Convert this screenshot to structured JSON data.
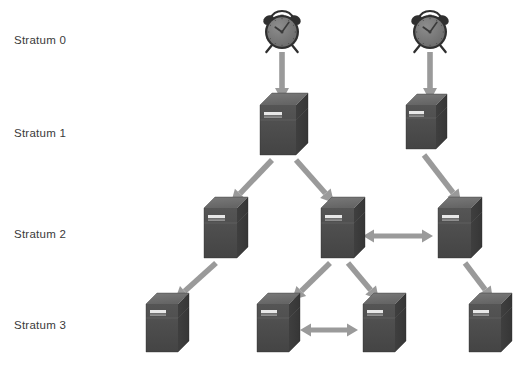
{
  "figure": {
    "background_color": "#ffffff",
    "width": 525,
    "height": 374
  },
  "colors": {
    "background": "#ffffff",
    "label_text": "#3a3a3a",
    "arrow": "#9a9a9a",
    "arrow_dark": "#8c8c8c",
    "server_front": "#4c4c4c",
    "server_top": "#6e6e6e",
    "server_side": "#3c3c3c",
    "server_seam": "#5e5e5e",
    "server_led": "#e8e8e8",
    "clock_body": "#6b6b6b",
    "clock_rim": "#2f2f2f",
    "clock_face": "#7e7e7e",
    "clock_hands": "#3a3a3a"
  },
  "labels": [
    {
      "id": "stratum-0",
      "text": "Stratum 0",
      "x": 14,
      "y": 35
    },
    {
      "id": "stratum-1",
      "text": "Stratum 1",
      "x": 14,
      "y": 128
    },
    {
      "id": "stratum-2",
      "text": "Stratum 2",
      "x": 14,
      "y": 229
    },
    {
      "id": "stratum-3",
      "text": "Stratum 3",
      "x": 14,
      "y": 320
    }
  ],
  "clocks": [
    {
      "id": "clock-left",
      "name": "reference-clock-left",
      "cx": 282,
      "cy": 32,
      "r": 17
    },
    {
      "id": "clock-right",
      "name": "reference-clock-right",
      "cx": 430,
      "cy": 32,
      "r": 17
    }
  ],
  "servers": [
    {
      "id": "s1-a",
      "name": "server-stratum1-a",
      "stratum": 1,
      "x": 260,
      "y": 105,
      "w": 36,
      "h": 50,
      "d": 12
    },
    {
      "id": "s1-b",
      "name": "server-stratum1-b",
      "stratum": 1,
      "x": 406,
      "y": 105,
      "w": 30,
      "h": 44,
      "d": 11
    },
    {
      "id": "s2-a",
      "name": "server-stratum2-a",
      "stratum": 2,
      "x": 204,
      "y": 208,
      "w": 33,
      "h": 50,
      "d": 11
    },
    {
      "id": "s2-b",
      "name": "server-stratum2-b",
      "stratum": 2,
      "x": 321,
      "y": 208,
      "w": 33,
      "h": 50,
      "d": 11
    },
    {
      "id": "s2-c",
      "name": "server-stratum2-c",
      "stratum": 2,
      "x": 438,
      "y": 208,
      "w": 33,
      "h": 50,
      "d": 11
    },
    {
      "id": "s3-a",
      "name": "server-stratum3-a",
      "stratum": 3,
      "x": 146,
      "y": 304,
      "w": 32,
      "h": 48,
      "d": 11
    },
    {
      "id": "s3-b",
      "name": "server-stratum3-b",
      "stratum": 3,
      "x": 257,
      "y": 304,
      "w": 32,
      "h": 48,
      "d": 11
    },
    {
      "id": "s3-c",
      "name": "server-stratum3-c",
      "stratum": 3,
      "x": 363,
      "y": 304,
      "w": 32,
      "h": 48,
      "d": 11
    },
    {
      "id": "s3-d",
      "name": "server-stratum3-d",
      "stratum": 3,
      "x": 469,
      "y": 304,
      "w": 32,
      "h": 48,
      "d": 11
    }
  ],
  "arrows": [
    {
      "id": "a-clk-l-s1a",
      "name": "arrow-clock-left-to-stratum1-a",
      "from": "clock-left",
      "to": "s1-a",
      "x1": 282,
      "y1": 52,
      "x2": 282,
      "y2": 101,
      "double": false
    },
    {
      "id": "a-clk-r-s1b",
      "name": "arrow-clock-right-to-stratum1-b",
      "from": "clock-right",
      "to": "s1-b",
      "x1": 430,
      "y1": 52,
      "x2": 430,
      "y2": 101,
      "double": false
    },
    {
      "id": "a-s1a-s2a",
      "name": "arrow-stratum1-a-to-stratum2-a",
      "from": "s1-a",
      "to": "s2-a",
      "x1": 272,
      "y1": 160,
      "x2": 231,
      "y2": 203,
      "double": false
    },
    {
      "id": "a-s1a-s2b",
      "name": "arrow-stratum1-a-to-stratum2-b",
      "from": "s1-a",
      "to": "s2-b",
      "x1": 296,
      "y1": 160,
      "x2": 334,
      "y2": 203,
      "double": false
    },
    {
      "id": "a-s1b-s2c",
      "name": "arrow-stratum1-b-to-stratum2-c",
      "from": "s1-b",
      "to": "s2-c",
      "x1": 424,
      "y1": 155,
      "x2": 461,
      "y2": 203,
      "double": false
    },
    {
      "id": "a-s2a-s3a",
      "name": "arrow-stratum2-a-to-stratum3-a",
      "from": "s2-a",
      "to": "s3-a",
      "x1": 216,
      "y1": 263,
      "x2": 175,
      "y2": 300,
      "double": false
    },
    {
      "id": "a-s2b-s3b",
      "name": "arrow-stratum2-b-to-stratum3-b",
      "from": "s2-b",
      "to": "s3-b",
      "x1": 330,
      "y1": 263,
      "x2": 292,
      "y2": 300,
      "double": false
    },
    {
      "id": "a-s2b-s3c",
      "name": "arrow-stratum2-b-to-stratum3-c",
      "from": "s2-b",
      "to": "s3-c",
      "x1": 348,
      "y1": 263,
      "x2": 379,
      "y2": 300,
      "double": false
    },
    {
      "id": "a-s2c-s3d",
      "name": "arrow-stratum2-c-to-stratum3-d",
      "from": "s2-c",
      "to": "s3-d",
      "x1": 465,
      "y1": 263,
      "x2": 493,
      "y2": 300,
      "double": false
    },
    {
      "id": "a-s2b-s2c-peer",
      "name": "arrow-peer-stratum2-b-c",
      "from": "s2-b",
      "to": "s2-c",
      "x1": 363,
      "y1": 236,
      "x2": 433,
      "y2": 236,
      "double": true
    },
    {
      "id": "a-s3b-s3c-peer",
      "name": "arrow-peer-stratum3-b-c",
      "from": "s3-b",
      "to": "s3-c",
      "x1": 300,
      "y1": 330,
      "x2": 358,
      "y2": 330,
      "double": true
    }
  ]
}
